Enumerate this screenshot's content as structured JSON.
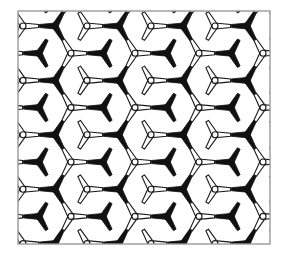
{
  "figure": {
    "background_color": "#ffffff",
    "canvas": {
      "width": 288,
      "height": 260
    }
  },
  "frame": {
    "name": "plot-border",
    "x": 18,
    "y": 11,
    "width": 252,
    "height": 233,
    "stroke_color": "#9a9a9a",
    "stroke_width": 1.4,
    "fill": "none"
  },
  "style": {
    "black_unit_fill": "#111111",
    "black_unit_stroke": "#111111",
    "white_unit_fill": "#ffffff",
    "white_unit_stroke": "#1a1a1a",
    "white_unit_stroke_width": 1.1,
    "hub_radius": 3.0,
    "arm_length": 15.6,
    "arm_half_width": 3.0,
    "arm_tip_half_width": 1.5
  },
  "lattice": {
    "type": "honeycomb",
    "column_spacing_px": 32.0,
    "row_spacing_px": 27.2,
    "row_x_offset_px": 16.0,
    "origin_x": 23.0,
    "origin_y": 26.0,
    "columns": 9,
    "rows": 9,
    "black_arm_angles_deg": [
      180,
      300,
      60
    ],
    "white_arm_angles_deg": [
      0,
      120,
      240
    ],
    "parity_rule": "even index sum -> white outlined unit, odd index sum -> black filled unit"
  },
  "legend": {
    "items": [
      {
        "name": "black-unit",
        "label": "filled trigonal unit",
        "color": "#111111"
      },
      {
        "name": "white-unit",
        "label": "outlined trigonal unit",
        "color": "#ffffff"
      }
    ]
  }
}
